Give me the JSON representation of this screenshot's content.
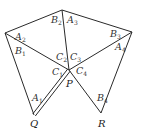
{
  "diagram": {
    "title": "",
    "colors": {
      "line": "#2a2a2a",
      "text": "#333333",
      "background": "#ffffff"
    },
    "vertices": {
      "L": {
        "x": 5,
        "y": 33
      },
      "T": {
        "x": 62,
        "y": 10
      },
      "Rt": {
        "x": 132,
        "y": 32
      },
      "P": {
        "x": 69,
        "y": 70,
        "label": "P"
      },
      "Q": {
        "x": 34,
        "y": 115,
        "label": "Q"
      },
      "R": {
        "x": 101,
        "y": 113,
        "label": "R"
      }
    },
    "edges": [
      {
        "from": "L",
        "to": "T",
        "style": "single"
      },
      {
        "from": "T",
        "to": "Rt",
        "style": "single"
      },
      {
        "from": "L",
        "to": "P",
        "style": "single"
      },
      {
        "from": "T",
        "to": "P",
        "style": "single"
      },
      {
        "from": "Rt",
        "to": "P",
        "style": "single"
      },
      {
        "from": "L",
        "to": "Q",
        "style": "single"
      },
      {
        "from": "Q",
        "to": "P",
        "style": "double"
      },
      {
        "from": "P",
        "to": "R",
        "style": "single"
      },
      {
        "from": "Rt",
        "to": "R",
        "style": "single"
      }
    ],
    "angle_labels": [
      {
        "base": "A",
        "sub": "1",
        "x": 32,
        "y": 101
      },
      {
        "base": "A",
        "sub": "2",
        "x": 15,
        "y": 40
      },
      {
        "base": "A",
        "sub": "3",
        "x": 67,
        "y": 23
      },
      {
        "base": "A",
        "sub": "4",
        "x": 115,
        "y": 50
      },
      {
        "base": "B",
        "sub": "1",
        "x": 15,
        "y": 54
      },
      {
        "base": "B",
        "sub": "2",
        "x": 51,
        "y": 23
      },
      {
        "base": "B",
        "sub": "3",
        "x": 110,
        "y": 37
      },
      {
        "base": "B",
        "sub": "4",
        "x": 97,
        "y": 101
      },
      {
        "base": "C",
        "sub": "1",
        "x": 52,
        "y": 75
      },
      {
        "base": "C",
        "sub": "2",
        "x": 56,
        "y": 60
      },
      {
        "base": "C",
        "sub": "3",
        "x": 70,
        "y": 60
      },
      {
        "base": "C",
        "sub": "4",
        "x": 76,
        "y": 74
      }
    ],
    "point_labels": {
      "P": "P",
      "Q": "Q",
      "R": "R"
    }
  }
}
